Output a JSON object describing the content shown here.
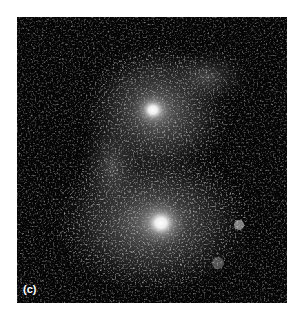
{
  "figure": {
    "panel_label": "(c)",
    "colors": {
      "background": "#050505",
      "core": "#ffffff",
      "page": "#ffffff"
    }
  }
}
